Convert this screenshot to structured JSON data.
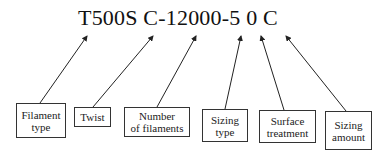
{
  "diagram": {
    "code": "T500S C-12000-5 0 C",
    "labels": [
      {
        "id": "filament-type",
        "text": "Filament type",
        "line1": "Filament",
        "line2": "type",
        "points_to": "T500S"
      },
      {
        "id": "twist",
        "text": "Twist",
        "line1": "Twist",
        "line2": "",
        "points_to": "C"
      },
      {
        "id": "number-of-filaments",
        "text": "Number of filaments",
        "line1": "Number",
        "line2": "of filaments",
        "points_to": "12000"
      },
      {
        "id": "sizing-type",
        "text": "Sizing type",
        "line1": "Sizing",
        "line2": "type",
        "points_to": "5"
      },
      {
        "id": "surface-treatment",
        "text": "Surface treatment",
        "line1": "Surface",
        "line2": "treatment",
        "points_to": "0"
      },
      {
        "id": "sizing-amount",
        "text": "Sizing amount",
        "line1": "Sizing",
        "line2": "amount",
        "points_to": "C"
      }
    ],
    "colors": {
      "line": "#222222",
      "text": "#111111",
      "background": "#ffffff"
    }
  }
}
